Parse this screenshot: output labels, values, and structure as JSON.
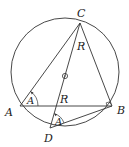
{
  "diagram": {
    "stroke_color": "#333333",
    "circle": {
      "cx": 65,
      "cy": 72,
      "r": 54
    },
    "center_marker": {
      "cx": 65,
      "cy": 76,
      "r": 2.5
    },
    "points": {
      "A": {
        "x": 20,
        "y": 106
      },
      "B": {
        "x": 112,
        "y": 106
      },
      "C": {
        "x": 80,
        "y": 23
      },
      "D": {
        "x": 50,
        "y": 128
      }
    },
    "labels": {
      "C": "C",
      "A": "A",
      "B": "B",
      "D": "D",
      "R_upper": "R",
      "R_lower": "R",
      "angle_at_A": "A",
      "angle_at_D": "A"
    },
    "segments": [
      "AC",
      "CB",
      "AB",
      "CD",
      "DB"
    ],
    "right_angle_at": "B"
  }
}
